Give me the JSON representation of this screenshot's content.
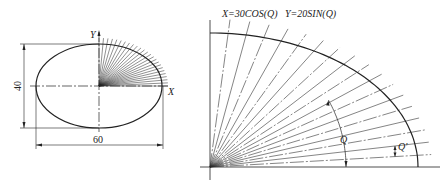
{
  "left_figure": {
    "axis_x_label": "X",
    "axis_y_label": "Y",
    "dim_height": "40",
    "dim_width": "60",
    "ellipse": {
      "cx": 99,
      "cy": 86,
      "rx": 63,
      "ry": 42
    },
    "ray_count": 24
  },
  "right_figure": {
    "equation_x": "X=30COS(Q)",
    "equation_y": "Y=20SIN(Q)",
    "angle_label": "Q",
    "angle_increment_label": "Q'",
    "origin": {
      "x": 210,
      "y": 167
    },
    "ellipse": {
      "rx": 208,
      "ry": 134
    },
    "ray_count": 18
  },
  "colors": {
    "stroke": "#222222",
    "background": "#ffffff"
  }
}
